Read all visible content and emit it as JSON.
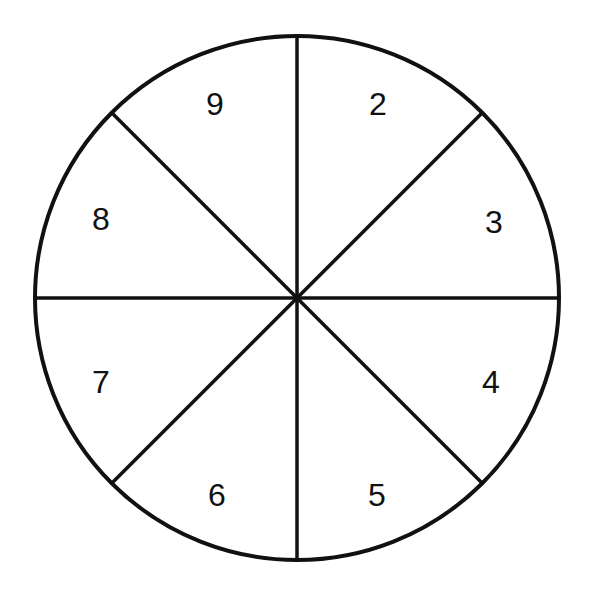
{
  "diagram": {
    "type": "spinner",
    "sections": 8,
    "center": [
      297,
      298
    ],
    "radius": 262,
    "stroke_color": "#111111",
    "labels": [
      {
        "text": "2",
        "x": 378,
        "y": 115
      },
      {
        "text": "3",
        "x": 494,
        "y": 233
      },
      {
        "text": "4",
        "x": 491,
        "y": 393
      },
      {
        "text": "5",
        "x": 377,
        "y": 506
      },
      {
        "text": "6",
        "x": 217,
        "y": 506
      },
      {
        "text": "7",
        "x": 101,
        "y": 393
      },
      {
        "text": "8",
        "x": 101,
        "y": 230
      },
      {
        "text": "9",
        "x": 215,
        "y": 115
      }
    ]
  }
}
